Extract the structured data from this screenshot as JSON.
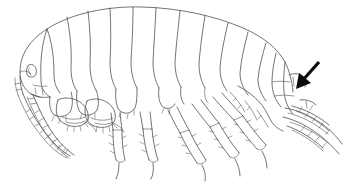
{
  "figure": {
    "view": "lateral",
    "orientation": "head-left-tail-right",
    "background_color": "#ffffff",
    "ink_color": "#4f4f4f",
    "annotation_color": "#0a0a0a",
    "canvas": {
      "width": 349,
      "height": 188
    }
  },
  "annotation": {
    "type": "arrow",
    "direction": "down-left",
    "label": "",
    "points_at": "uropod-telson-region",
    "shaft_start": {
      "x": 319,
      "y": 62
    },
    "tip": {
      "x": 296,
      "y": 89
    }
  },
  "anatomy": {
    "parts": [
      {
        "name": "head",
        "label": "head"
      },
      {
        "name": "eye",
        "label": "eye"
      },
      {
        "name": "antenna-1",
        "label": "antenna 1"
      },
      {
        "name": "antenna-2",
        "label": "antenna 2"
      },
      {
        "name": "gnathopod-1",
        "label": "gnathopod 1"
      },
      {
        "name": "gnathopod-2",
        "label": "gnathopod 2"
      },
      {
        "name": "pereon",
        "label": "pereon"
      },
      {
        "name": "coxal-plates",
        "label": "coxal plates"
      },
      {
        "name": "pereopod-3",
        "label": "pereopod 3"
      },
      {
        "name": "pereopod-4",
        "label": "pereopod 4"
      },
      {
        "name": "pereopod-5",
        "label": "pereopod 5"
      },
      {
        "name": "pereopod-6",
        "label": "pereopod 6"
      },
      {
        "name": "pereopod-7",
        "label": "pereopod 7"
      },
      {
        "name": "pleon",
        "label": "pleon"
      },
      {
        "name": "urosome",
        "label": "urosome"
      },
      {
        "name": "uropods",
        "label": "uropods"
      },
      {
        "name": "telson",
        "label": "telson"
      }
    ],
    "segment_count": {
      "pereon": 7,
      "pleon": 3,
      "urosome": 3
    }
  },
  "caption": ""
}
